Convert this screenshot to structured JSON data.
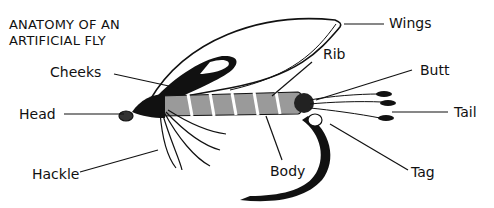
{
  "diagram": {
    "title_lines": [
      "ANATOMY OF AN",
      "ARTIFICIAL FLY"
    ],
    "labels": {
      "wings": "Wings",
      "rib": "Rib",
      "butt": "Butt",
      "tail": "Tail",
      "tag": "Tag",
      "body": "Body",
      "hackle": "Hackle",
      "head": "Head",
      "cheeks": "Cheeks"
    },
    "colors": {
      "ink": "#111111",
      "background": "#ffffff",
      "body_fill": "#9a9a9a"
    }
  }
}
